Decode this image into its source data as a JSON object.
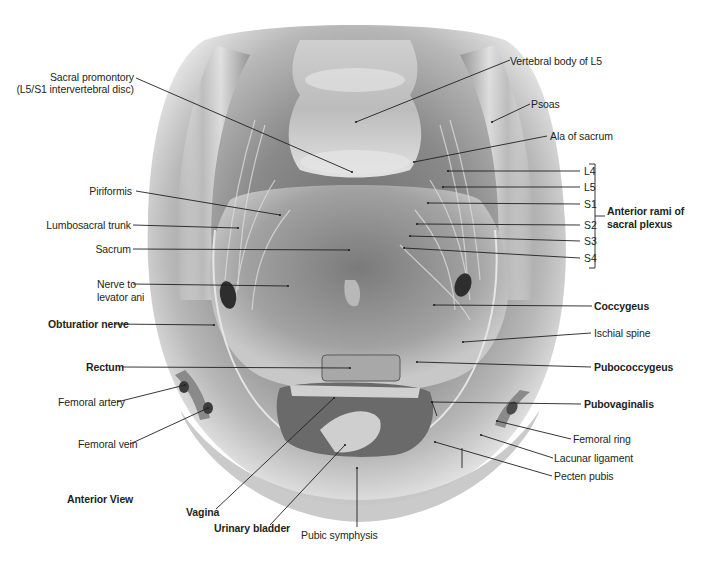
{
  "figure": {
    "view_label": "Anterior View",
    "labels": {
      "sacral_promontory": "Sacral promontory",
      "sacral_promontory_sub": "(L5/S1 intervertebral disc)",
      "vertebral_body_l5": "Vertebral body of L5",
      "psoas": "Psoas",
      "ala_of_sacrum": "Ala of sacrum",
      "l4": "L4",
      "l5": "L5",
      "s1": "S1",
      "s2": "S2",
      "s3": "S3",
      "s4": "S4",
      "anterior_rami_line1": "Anterior rami of",
      "anterior_rami_line2": "sacral plexus",
      "piriformis": "Piriformis",
      "lumbosacral_trunk": "Lumbosacral trunk",
      "sacrum": "Sacrum",
      "nerve_to_levator_line1": "Nerve to",
      "nerve_to_levator_line2": "levator ani",
      "obturator_nerve": "Obturatior nerve",
      "coccygeus": "Coccygeus",
      "ischial_spine": "Ischial spine",
      "rectum": "Rectum",
      "pubococcygeus": "Pubococcygeus",
      "femoral_artery": "Femoral artery",
      "pubovaginalis": "Pubovaginalis",
      "femoral_vein": "Femoral vein",
      "femoral_ring": "Femoral ring",
      "lacunar_ligament": "Lacunar ligament",
      "pecten_pubis": "Pecten pubis",
      "vagina": "Vagina",
      "urinary_bladder": "Urinary bladder",
      "pubic_symphysis": "Pubic symphysis"
    },
    "colors": {
      "background": "#ffffff",
      "text": "#231f20",
      "leader": "#231f20",
      "tissue_dark": "#5a5a5a",
      "tissue_mid": "#8c8c8c",
      "tissue_light": "#d2d2d2"
    }
  }
}
